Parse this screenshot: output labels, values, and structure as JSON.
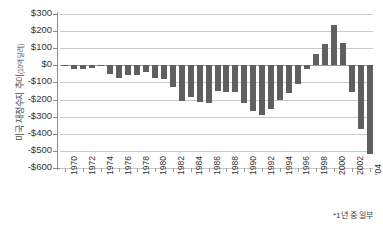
{
  "chart_data": {
    "type": "bar",
    "title": "미국 재정수지 추이(10억 달러)",
    "xlabel": "",
    "ylabel": "미국 재정수지 추이(10억 달러)",
    "ylabel_main": "미국 재정수지 추이",
    "ylabel_unit": "(10억 달러)",
    "ylim": [
      -600,
      300
    ],
    "ytick_labels": [
      "$300",
      "$200",
      "$100",
      "$0",
      "-$100",
      "-$200",
      "-$300",
      "-$400",
      "-$500",
      "-$600"
    ],
    "ytick_values": [
      300,
      200,
      100,
      0,
      -100,
      -200,
      -300,
      -400,
      -500,
      -600
    ],
    "grid": true,
    "legend": "none",
    "bar_color": "#5f5f5f",
    "footnote": "*1년 중 일부",
    "x": [
      1970,
      1971,
      1972,
      1973,
      1974,
      1975,
      1976,
      1977,
      1978,
      1979,
      1980,
      1981,
      1982,
      1983,
      1984,
      1985,
      1986,
      1987,
      1988,
      1989,
      1990,
      1991,
      1992,
      1993,
      1994,
      1995,
      1996,
      1997,
      1998,
      1999,
      2000,
      2001,
      2002,
      2003,
      2004
    ],
    "xtick_labels": [
      "1970",
      "1972",
      "1974",
      "1976",
      "1978",
      "1980",
      "1982",
      "1984",
      "1986",
      "1988",
      "1990",
      "1992",
      "1994",
      "1996",
      "1998",
      "2000",
      "2002",
      "'04"
    ],
    "xtick_years": [
      1970,
      1972,
      1974,
      1976,
      1978,
      1980,
      1982,
      1984,
      1986,
      1988,
      1990,
      1992,
      1994,
      1996,
      1998,
      2000,
      2002,
      2004
    ],
    "values": [
      -3,
      -23,
      -23,
      -15,
      -6,
      -53,
      -74,
      -54,
      -59,
      -41,
      -74,
      -79,
      -128,
      -208,
      -185,
      -212,
      -221,
      -150,
      -155,
      -153,
      -221,
      -269,
      -290,
      -255,
      -203,
      -164,
      -107,
      -22,
      69,
      126,
      236,
      128,
      -158,
      -375,
      -520
    ],
    "values_unit": "billions of USD",
    "note_last_point": "'04 is partial-year"
  }
}
